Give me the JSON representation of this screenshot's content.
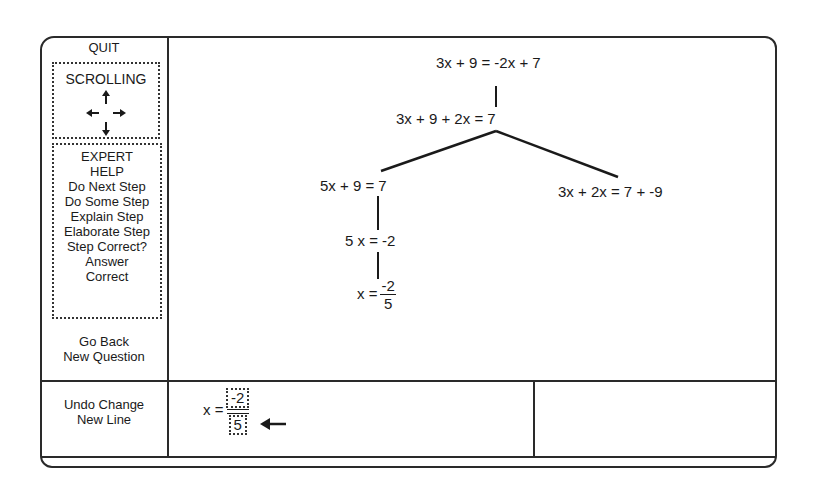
{
  "sidebar": {
    "quit": "QUIT",
    "scrolling": {
      "title": "SCROLLING",
      "arrows": [
        "up-arrow",
        "left-arrow",
        "right-arrow",
        "down-arrow"
      ]
    },
    "expert_help": {
      "title_line1": "EXPERT",
      "title_line2": "HELP",
      "items": [
        "Do Next Step",
        "Do Some Step",
        "Explain Step",
        "Elaborate Step",
        "Step Correct?",
        "Answer",
        "Correct"
      ]
    },
    "go_back": "Go Back",
    "new_question": "New Question",
    "undo_change": "Undo Change",
    "new_line": "New Line"
  },
  "tree": {
    "root": "3x + 9 = -2x + 7",
    "step1": "3x + 9 + 2x = 7",
    "left_branch": "5x + 9 = 7",
    "right_branch": "3x + 2x = 7 + -9",
    "left_step2": "5 x = -2",
    "left_step3": {
      "lhs": "x =",
      "numerator": "-2",
      "denominator": "5"
    }
  },
  "editor": {
    "lhs": "x =",
    "numerator": "-2",
    "denominator": "5",
    "pointer": "left-arrow"
  }
}
